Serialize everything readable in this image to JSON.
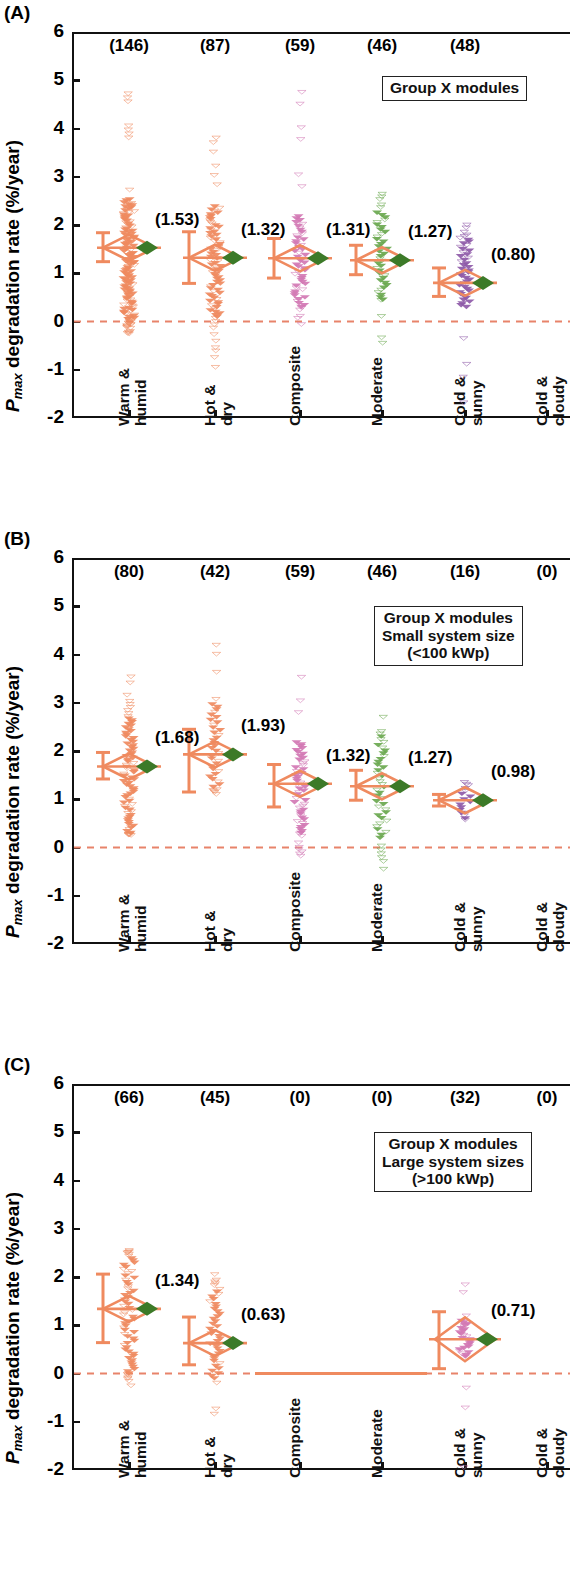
{
  "figure": {
    "ylabel_main": "degradation rate (%/year)",
    "ylabel_p": "P",
    "ylabel_sub": "max",
    "y_ticks": [
      "6",
      "5",
      "4",
      "3",
      "2",
      "1",
      "0",
      "-1",
      "-2"
    ],
    "categories": [
      "Warm & humid",
      "Hot & dry",
      "Composite",
      "Moderate",
      "Cold & sunny",
      "Cold & cloudy"
    ],
    "category_lines": [
      [
        "Warm &",
        "humid"
      ],
      [
        "Hot &",
        "dry"
      ],
      [
        "Composite",
        ""
      ],
      [
        "Moderate",
        ""
      ],
      [
        "Cold &",
        "sunny"
      ],
      [
        "Cold &",
        "cloudy"
      ]
    ]
  },
  "panels": [
    {
      "letter": "(A)",
      "legend_lines": [
        "Group X modules"
      ],
      "counts": [
        "(146)",
        "(87)",
        "(59)",
        "(46)",
        "(48)",
        ""
      ],
      "means": [
        "(1.53)",
        "(1.32)",
        "(1.31)",
        "(1.27)",
        "(0.80)",
        ""
      ]
    },
    {
      "letter": "(B)",
      "legend_lines": [
        "Group X modules",
        "Small system size",
        "(<100 kWp)"
      ],
      "counts": [
        "(80)",
        "(42)",
        "(59)",
        "(46)",
        "(16)",
        "(0)"
      ],
      "means": [
        "(1.68)",
        "(1.93)",
        "(1.32)",
        "(1.27)",
        "(0.98)",
        ""
      ]
    },
    {
      "letter": "(C)",
      "legend_lines": [
        "Group X modules",
        "Large system sizes",
        "(>100 kWp)"
      ],
      "counts": [
        "(66)",
        "(45)",
        "(0)",
        "(0)",
        "(32)",
        "(0)"
      ],
      "means": [
        "(1.34)",
        "(0.63)",
        "",
        "",
        "(0.71)",
        ""
      ]
    }
  ],
  "colors": {
    "orange": "#ef8a5f",
    "pink": "#d278b4",
    "green": "#6aa84f",
    "purple": "#8e5aa8",
    "dark_green": "#3c7a28",
    "zero_line": "#e8836a",
    "axis": "#111111"
  },
  "chart_data": {
    "type": "scatter",
    "xlabel": "",
    "ylabel": "Pmax degradation rate (%/year)",
    "ylim": [
      -2,
      6
    ],
    "yticks": [
      -2,
      -1,
      0,
      1,
      2,
      3,
      4,
      5,
      6
    ],
    "grid": false,
    "legend_position": "inside-top-right",
    "categories": [
      "Warm & humid",
      "Hot & dry",
      "Composite",
      "Moderate",
      "Cold & sunny",
      "Cold & cloudy"
    ],
    "panels": [
      {
        "panel": "A",
        "label": "Group X modules",
        "counts": [
          146,
          87,
          59,
          46,
          48,
          0
        ],
        "means": [
          1.53,
          1.32,
          1.31,
          1.27,
          0.8,
          null
        ],
        "series_colors": [
          "#ef8a5f",
          "#ef8a5f",
          "#d278b4",
          "#6aa84f",
          "#8e5aa8",
          null
        ],
        "error_bars": [
          {
            "lo": 1.24,
            "hi": 1.84
          },
          {
            "lo": 0.79,
            "hi": 1.86
          },
          {
            "lo": 0.9,
            "hi": 1.72
          },
          {
            "lo": 0.97,
            "hi": 1.58
          },
          {
            "lo": 0.52,
            "hi": 1.11
          },
          null
        ],
        "data_ranges": [
          {
            "min": -0.3,
            "max": 4.72,
            "dense_lo": 0.05,
            "dense_hi": 2.55
          },
          {
            "min": -0.95,
            "max": 3.9,
            "dense_lo": 0.1,
            "dense_hi": 2.4
          },
          {
            "min": -0.15,
            "max": 4.75,
            "dense_lo": 0.3,
            "dense_hi": 2.2
          },
          {
            "min": -0.45,
            "max": 2.75,
            "dense_lo": 0.45,
            "dense_hi": 2.3
          },
          {
            "min": -1.95,
            "max": 2.0,
            "dense_lo": 0.3,
            "dense_hi": 1.75
          },
          null
        ]
      },
      {
        "panel": "B",
        "label": "Group X modules, Small system size (<100 kWp)",
        "counts": [
          80,
          42,
          59,
          46,
          16,
          0
        ],
        "means": [
          1.68,
          1.93,
          1.32,
          1.27,
          0.98,
          null
        ],
        "series_colors": [
          "#ef8a5f",
          "#ef8a5f",
          "#d278b4",
          "#6aa84f",
          "#8e5aa8",
          null
        ],
        "error_bars": [
          {
            "lo": 1.42,
            "hi": 1.97
          },
          {
            "lo": 1.15,
            "hi": 2.45
          },
          {
            "lo": 0.84,
            "hi": 1.72
          },
          {
            "lo": 0.98,
            "hi": 1.6
          },
          {
            "lo": 0.86,
            "hi": 1.1
          },
          null
        ],
        "data_ranges": [
          {
            "min": 0.25,
            "max": 3.6,
            "dense_lo": 0.3,
            "dense_hi": 2.7
          },
          {
            "min": 1.1,
            "max": 4.38,
            "dense_lo": 1.2,
            "dense_hi": 3.0
          },
          {
            "min": -0.18,
            "max": 4.75,
            "dense_lo": 0.3,
            "dense_hi": 2.2
          },
          {
            "min": -0.45,
            "max": 2.75,
            "dense_lo": 0.2,
            "dense_hi": 2.35
          },
          {
            "min": 0.55,
            "max": 1.35,
            "dense_lo": 0.6,
            "dense_hi": 1.3
          },
          null
        ]
      },
      {
        "panel": "C",
        "label": "Group X modules, Large system sizes (>100 kWp)",
        "counts": [
          66,
          45,
          0,
          0,
          32,
          0
        ],
        "means": [
          1.34,
          0.63,
          null,
          null,
          0.71,
          null
        ],
        "series_colors": [
          "#ef8a5f",
          "#ef8a5f",
          null,
          null,
          "#d278b4",
          null
        ],
        "error_bars": [
          {
            "lo": 0.64,
            "hi": 2.06
          },
          {
            "lo": 0.18,
            "hi": 1.17
          },
          null,
          null,
          {
            "lo": 0.1,
            "hi": 1.28
          },
          null
        ],
        "data_ranges": [
          {
            "min": -0.28,
            "max": 2.55,
            "dense_lo": 0.0,
            "dense_hi": 2.4
          },
          {
            "min": -0.95,
            "max": 2.05,
            "dense_lo": -0.1,
            "dense_hi": 1.75
          },
          null,
          null,
          {
            "min": -1.95,
            "max": 2.0,
            "dense_lo": 0.35,
            "dense_hi": 1.1
          },
          null
        ]
      }
    ]
  }
}
